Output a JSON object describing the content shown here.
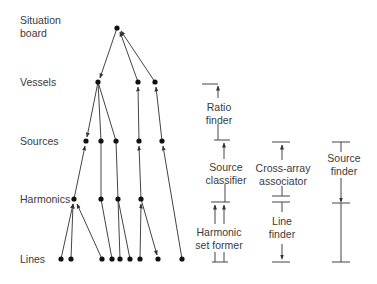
{
  "levels": {
    "situation_board_line1": "Situation",
    "situation_board_line2": "board",
    "vessels": "Vessels",
    "sources": "Sources",
    "harmonics": "Harmonics",
    "lines": "Lines"
  },
  "processes": {
    "ratio_finder": {
      "line1": "Ratio",
      "line2": "finder"
    },
    "source_classifier": {
      "line1": "Source",
      "line2": "classifier"
    },
    "harmonic_set_former": {
      "line1": "Harmonic",
      "line2": "set former"
    },
    "cross_array_associator": {
      "line1": "Cross-array",
      "line2": "associator"
    },
    "line_finder": {
      "line1": "Line",
      "line2": "finder"
    },
    "source_finder": {
      "line1": "Source",
      "line2": "finder"
    }
  },
  "colors": {
    "line": "#444444",
    "node": "#111111",
    "text": "#3a3a3a"
  }
}
